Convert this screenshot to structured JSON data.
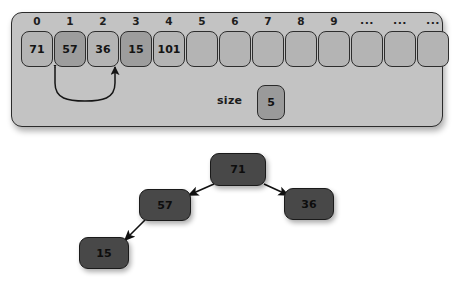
{
  "array_panel": {
    "name": "array-visualization-panel",
    "index_labels": [
      "0",
      "1",
      "2",
      "3",
      "4",
      "5",
      "6",
      "7",
      "8",
      "9",
      "...",
      "...",
      "..."
    ],
    "cells": [
      {
        "index": "0",
        "value": "71",
        "highlighted": false
      },
      {
        "index": "1",
        "value": "57",
        "highlighted": true
      },
      {
        "index": "2",
        "value": "36",
        "highlighted": false
      },
      {
        "index": "3",
        "value": "15",
        "highlighted": true
      },
      {
        "index": "4",
        "value": "101",
        "highlighted": false
      },
      {
        "index": "5",
        "value": "",
        "highlighted": false
      },
      {
        "index": "6",
        "value": "",
        "highlighted": false
      },
      {
        "index": "7",
        "value": "",
        "highlighted": false
      },
      {
        "index": "8",
        "value": "",
        "highlighted": false
      },
      {
        "index": "9",
        "value": "",
        "highlighted": false
      },
      {
        "index": "...",
        "value": "",
        "highlighted": false
      },
      {
        "index": "...",
        "value": "",
        "highlighted": false
      },
      {
        "index": "...",
        "value": "",
        "highlighted": false
      }
    ],
    "size": {
      "label": "size",
      "value": "5"
    },
    "swap_arrow": {
      "name": "swap-arrow",
      "from_index": "1",
      "to_index": "3"
    }
  },
  "tree": {
    "name": "binary-tree-diagram",
    "nodes": [
      {
        "id": "root",
        "value": "71",
        "x": 210,
        "y": 13,
        "w": 56,
        "h": 33
      },
      {
        "id": "left",
        "value": "57",
        "x": 139,
        "y": 49,
        "w": 52,
        "h": 32
      },
      {
        "id": "right",
        "value": "36",
        "x": 284,
        "y": 48,
        "w": 50,
        "h": 32
      },
      {
        "id": "left-left",
        "value": "15",
        "x": 79,
        "y": 97,
        "w": 50,
        "h": 32
      }
    ],
    "edges": [
      {
        "from": "root",
        "to": "left",
        "label": "left-child-edge"
      },
      {
        "from": "root",
        "to": "right",
        "label": "right-child-edge"
      },
      {
        "from": "left",
        "to": "left-left",
        "label": "left-child-edge"
      }
    ]
  },
  "colors": {
    "panel_bg": "#c3c3c3",
    "cell_bg": "#b4b4b4",
    "cell_highlight_bg": "#9d9d9d",
    "node_bg": "#484848",
    "stroke": "#2b2b2b",
    "page_bg": "#ffffff"
  }
}
